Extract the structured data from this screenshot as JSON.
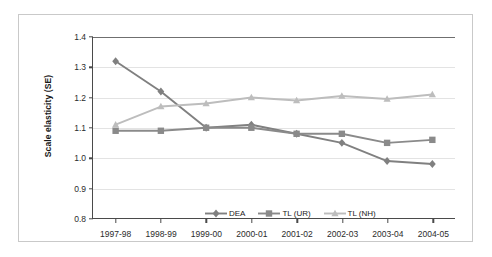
{
  "chart_data": {
    "type": "line",
    "title": "",
    "xlabel": "",
    "ylabel": "Scale elasticity (SE)",
    "categories": [
      "1997-98",
      "1998-99",
      "1999-00",
      "2000-01",
      "2001-02",
      "2002-03",
      "2003-04",
      "2004-05"
    ],
    "ylim": [
      0.8,
      1.4
    ],
    "yticks": [
      "0.8",
      "0.9",
      "1.0",
      "1.1",
      "1.2",
      "1.3",
      "1.4"
    ],
    "ytick_values": [
      0.8,
      0.9,
      1.0,
      1.1,
      1.2,
      1.3,
      1.4
    ],
    "grid": true,
    "legend_position": "inside-bottom-center",
    "series": [
      {
        "name": "DEA",
        "marker": "diamond",
        "color": "#808080",
        "values": [
          1.32,
          1.22,
          1.1,
          1.11,
          1.08,
          1.05,
          0.99,
          0.98
        ]
      },
      {
        "name": "TL (UR)",
        "marker": "square",
        "color": "#8a8a8a",
        "values": [
          1.09,
          1.09,
          1.1,
          1.1,
          1.08,
          1.08,
          1.05,
          1.06
        ]
      },
      {
        "name": "TL (NH)",
        "marker": "triangle",
        "color": "#bdbdbd",
        "values": [
          1.11,
          1.17,
          1.18,
          1.2,
          1.19,
          1.205,
          1.195,
          1.21
        ]
      }
    ]
  },
  "figure": {
    "background_color": "#ffffff",
    "frame_color": "#c9c9c9",
    "axis_color": "#4a4a4a",
    "gridline_color": "#e3e3e3"
  }
}
